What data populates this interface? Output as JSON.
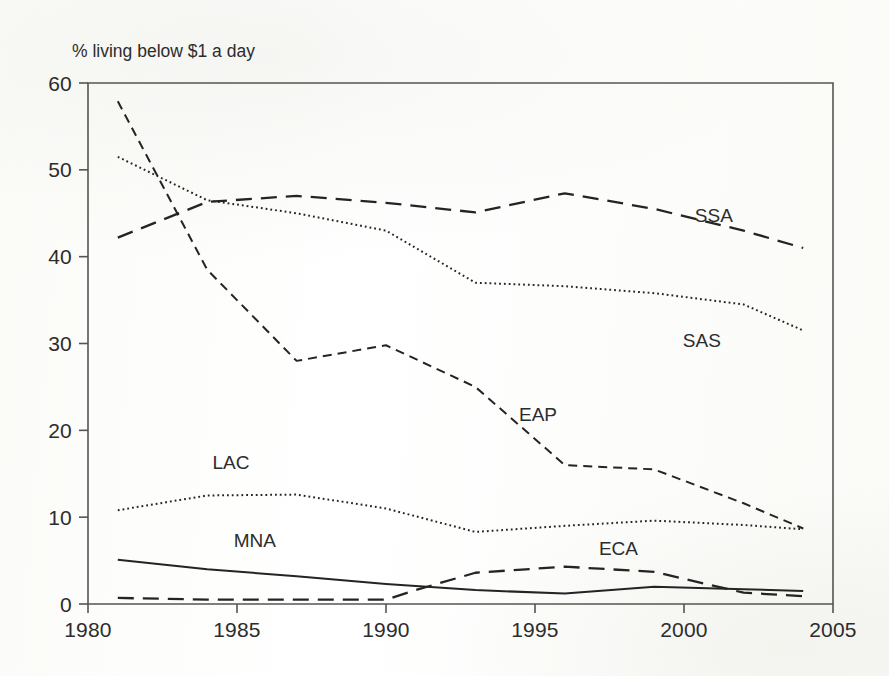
{
  "figure": {
    "background_color": "#fcfcfa",
    "axis_color": "#555550",
    "line_color": "#242424"
  },
  "chart_data": {
    "type": "line",
    "title": "",
    "subtitle": "",
    "ylabel": "% living below $1 a day",
    "xlabel": "",
    "xlim": [
      1980,
      2005
    ],
    "ylim": [
      0,
      60
    ],
    "xticks": [
      1980,
      1985,
      1990,
      1995,
      2000,
      2005
    ],
    "yticks": [
      0,
      10,
      20,
      30,
      40,
      50,
      60
    ],
    "grid": false,
    "legend": "inline-labels",
    "annotations": [
      {
        "text": "SSA",
        "x": 2001.0,
        "y": 44.0
      },
      {
        "text": "SAS",
        "x": 2000.6,
        "y": 29.6
      },
      {
        "text": "EAP",
        "x": 1995.1,
        "y": 21.1
      },
      {
        "text": "LAC",
        "x": 1984.8,
        "y": 15.6
      },
      {
        "text": "MNA",
        "x": 1985.6,
        "y": 6.6
      },
      {
        "text": "ECA",
        "x": 1997.8,
        "y": 5.6
      }
    ],
    "series": [
      {
        "name": "SSA",
        "label": "SSA",
        "style": "dashed",
        "x": [
          1981,
          1984,
          1987,
          1990,
          1993,
          1996,
          1999,
          2002,
          2004
        ],
        "values": [
          42.2,
          46.3,
          47.0,
          46.2,
          45.1,
          47.3,
          45.5,
          43.0,
          41.0
        ]
      },
      {
        "name": "SAS",
        "label": "SAS",
        "style": "dotted",
        "x": [
          1981,
          1984,
          1987,
          1990,
          1993,
          1996,
          1999,
          2002,
          2004
        ],
        "values": [
          51.5,
          46.5,
          45.0,
          43.0,
          37.0,
          36.6,
          35.8,
          34.5,
          31.5
        ]
      },
      {
        "name": "EAP",
        "label": "EAP",
        "style": "dashed-short",
        "x": [
          1981,
          1984,
          1987,
          1990,
          1993,
          1996,
          1999,
          2002,
          2004
        ],
        "values": [
          57.9,
          38.5,
          28.0,
          29.8,
          25.0,
          16.0,
          15.5,
          11.6,
          8.7
        ]
      },
      {
        "name": "LAC",
        "label": "LAC",
        "style": "dotted",
        "x": [
          1981,
          1984,
          1987,
          1990,
          1993,
          1996,
          1999,
          2002,
          2004
        ],
        "values": [
          10.8,
          12.5,
          12.6,
          11.0,
          8.3,
          9.0,
          9.6,
          9.1,
          8.6
        ]
      },
      {
        "name": "MNA",
        "label": "MNA",
        "style": "solid",
        "x": [
          1981,
          1984,
          1987,
          1990,
          1993,
          1996,
          1999,
          2002,
          2004
        ],
        "values": [
          5.1,
          4.0,
          3.2,
          2.3,
          1.6,
          1.2,
          2.0,
          1.7,
          1.5
        ]
      },
      {
        "name": "ECA",
        "label": "ECA",
        "style": "dashed",
        "x": [
          1981,
          1984,
          1987,
          1990,
          1991,
          1993,
          1996,
          1999,
          2002,
          2004
        ],
        "values": [
          0.7,
          0.5,
          0.5,
          0.5,
          1.6,
          3.6,
          4.3,
          3.7,
          1.3,
          0.9
        ]
      }
    ]
  }
}
